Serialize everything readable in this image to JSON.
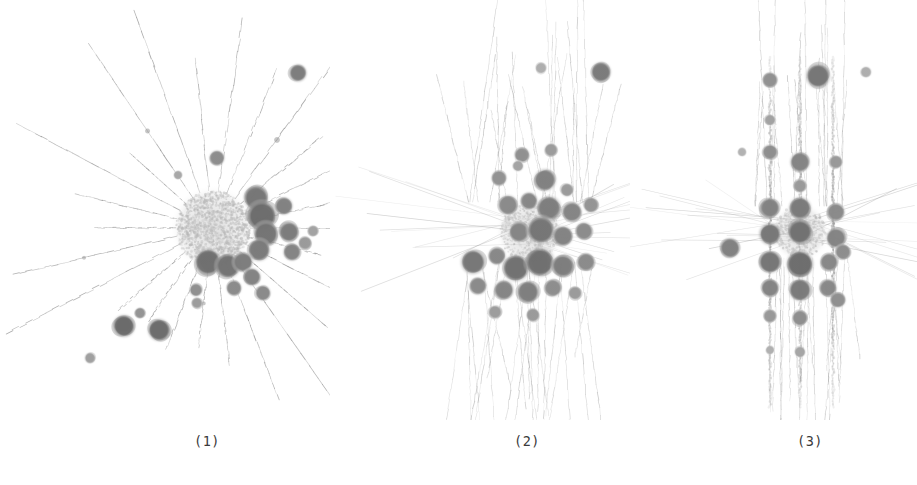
{
  "figure": {
    "width": 917,
    "height": 485,
    "background": "#ffffff",
    "ink_color": "#707070",
    "core_color": "#d8d8d8",
    "node_dark_color": "#6e6e6e",
    "edge_color": "#9a9a9a"
  },
  "panels": [
    {
      "id": "panel-1",
      "caption": "(1)",
      "layout_type": "radial-star",
      "x": 0,
      "y": 0,
      "width": 330,
      "height": 420,
      "caption_x": 207,
      "center_x": 213,
      "center_y": 228,
      "core_radius": 37,
      "spoke_count": 26,
      "description": "Dense light core with long radial spokes and dark satellite node clusters concentrated to the right and lower-right."
    },
    {
      "id": "panel-2",
      "caption": "(2)",
      "layout_type": "scattered-cluster",
      "x": 330,
      "y": 0,
      "width": 300,
      "height": 420,
      "caption_x": 527,
      "center_x": 530,
      "center_y": 235,
      "core_radius": 30,
      "spoke_count": 40,
      "description": "Diffuse cloud of medium grey blobs with faint vertical streaks fanning above and below the centre."
    },
    {
      "id": "panel-3",
      "caption": "(3)",
      "layout_type": "vertical-bands",
      "x": 630,
      "y": 0,
      "width": 287,
      "height": 420,
      "caption_x": 810,
      "center_x": 800,
      "center_y": 235,
      "core_radius": 26,
      "spoke_count": 30,
      "description": "Three dominant vertical columns of stacked node blobs with horizontal spokes crossing the middle band."
    }
  ],
  "chart_data": {
    "type": "scatter",
    "title": "",
    "xlabel": "",
    "ylabel": "",
    "legend": [],
    "panels": [
      {
        "label": "(1)",
        "name": "radial-star",
        "core": {
          "cx": 213,
          "cy": 228,
          "r": 37,
          "fill": "#d8d8d8",
          "dot_count": 1400
        },
        "spoke_angles_deg": [
          0,
          14,
          27,
          41,
          55,
          69,
          83,
          97,
          111,
          125,
          139,
          153,
          167,
          180,
          194,
          208,
          222,
          236,
          250,
          264,
          278,
          292,
          306,
          320,
          334,
          348
        ],
        "spoke_length_range": [
          70,
          205
        ],
        "nodes": [
          {
            "x": 298,
            "y": 73,
            "r": 8,
            "shade": "#7d7d7d"
          },
          {
            "x": 217,
            "y": 158,
            "r": 7,
            "shade": "#8d8d8d"
          },
          {
            "x": 178,
            "y": 175,
            "r": 4,
            "shade": "#a8a8a8"
          },
          {
            "x": 256,
            "y": 198,
            "r": 11,
            "shade": "#767676"
          },
          {
            "x": 262,
            "y": 216,
            "r": 13,
            "shade": "#6d6d6d"
          },
          {
            "x": 266,
            "y": 234,
            "r": 11,
            "shade": "#757575"
          },
          {
            "x": 259,
            "y": 250,
            "r": 10,
            "shade": "#7b7b7b"
          },
          {
            "x": 284,
            "y": 206,
            "r": 8,
            "shade": "#828282"
          },
          {
            "x": 289,
            "y": 232,
            "r": 9,
            "shade": "#7c7c7c"
          },
          {
            "x": 292,
            "y": 252,
            "r": 8,
            "shade": "#848484"
          },
          {
            "x": 305,
            "y": 243,
            "r": 6,
            "shade": "#9a9a9a"
          },
          {
            "x": 313,
            "y": 231,
            "r": 5,
            "shade": "#a3a3a3"
          },
          {
            "x": 208,
            "y": 262,
            "r": 12,
            "shade": "#6f6f6f"
          },
          {
            "x": 228,
            "y": 266,
            "r": 11,
            "shade": "#737373"
          },
          {
            "x": 243,
            "y": 262,
            "r": 9,
            "shade": "#7d7d7d"
          },
          {
            "x": 252,
            "y": 277,
            "r": 8,
            "shade": "#838383"
          },
          {
            "x": 234,
            "y": 288,
            "r": 7,
            "shade": "#8b8b8b"
          },
          {
            "x": 196,
            "y": 290,
            "r": 6,
            "shade": "#909090"
          },
          {
            "x": 263,
            "y": 293,
            "r": 7,
            "shade": "#8a8a8a"
          },
          {
            "x": 197,
            "y": 303,
            "r": 5,
            "shade": "#9d9d9d"
          },
          {
            "x": 124,
            "y": 326,
            "r": 10,
            "shade": "#6a6a6a"
          },
          {
            "x": 159,
            "y": 330,
            "r": 10,
            "shade": "#6c6c6c"
          },
          {
            "x": 140,
            "y": 313,
            "r": 5,
            "shade": "#949494"
          },
          {
            "x": 90,
            "y": 358,
            "r": 5,
            "shade": "#a0a0a0"
          }
        ]
      },
      {
        "label": "(2)",
        "name": "scattered-cluster",
        "core": {
          "cx": 530,
          "cy": 232,
          "r": 30,
          "fill": "#e4e4e4",
          "dot_count": 500
        },
        "streak_count": 46,
        "nodes": [
          {
            "x": 601,
            "y": 72,
            "r": 9,
            "shade": "#7b7b7b"
          },
          {
            "x": 541,
            "y": 68,
            "r": 5,
            "shade": "#aeaeae"
          },
          {
            "x": 522,
            "y": 155,
            "r": 7,
            "shade": "#909090"
          },
          {
            "x": 551,
            "y": 150,
            "r": 6,
            "shade": "#9c9c9c"
          },
          {
            "x": 499,
            "y": 178,
            "r": 7,
            "shade": "#939393"
          },
          {
            "x": 518,
            "y": 166,
            "r": 5,
            "shade": "#a4a4a4"
          },
          {
            "x": 545,
            "y": 180,
            "r": 10,
            "shade": "#818181"
          },
          {
            "x": 567,
            "y": 190,
            "r": 6,
            "shade": "#9b9b9b"
          },
          {
            "x": 508,
            "y": 205,
            "r": 9,
            "shade": "#8a8a8a"
          },
          {
            "x": 529,
            "y": 201,
            "r": 8,
            "shade": "#878787"
          },
          {
            "x": 549,
            "y": 208,
            "r": 11,
            "shade": "#7e7e7e"
          },
          {
            "x": 572,
            "y": 212,
            "r": 9,
            "shade": "#858585"
          },
          {
            "x": 591,
            "y": 205,
            "r": 7,
            "shade": "#949494"
          },
          {
            "x": 519,
            "y": 232,
            "r": 9,
            "shade": "#868686"
          },
          {
            "x": 541,
            "y": 230,
            "r": 12,
            "shade": "#767676"
          },
          {
            "x": 563,
            "y": 236,
            "r": 9,
            "shade": "#838383"
          },
          {
            "x": 584,
            "y": 231,
            "r": 8,
            "shade": "#8c8c8c"
          },
          {
            "x": 473,
            "y": 262,
            "r": 11,
            "shade": "#777777"
          },
          {
            "x": 497,
            "y": 256,
            "r": 8,
            "shade": "#888888"
          },
          {
            "x": 516,
            "y": 268,
            "r": 12,
            "shade": "#727272"
          },
          {
            "x": 540,
            "y": 262,
            "r": 13,
            "shade": "#6f6f6f"
          },
          {
            "x": 563,
            "y": 266,
            "r": 10,
            "shade": "#7d7d7d"
          },
          {
            "x": 586,
            "y": 262,
            "r": 8,
            "shade": "#8b8b8b"
          },
          {
            "x": 478,
            "y": 286,
            "r": 8,
            "shade": "#8a8a8a"
          },
          {
            "x": 504,
            "y": 290,
            "r": 9,
            "shade": "#858585"
          },
          {
            "x": 528,
            "y": 292,
            "r": 10,
            "shade": "#7f7f7f"
          },
          {
            "x": 553,
            "y": 288,
            "r": 8,
            "shade": "#8d8d8d"
          },
          {
            "x": 575,
            "y": 293,
            "r": 6,
            "shade": "#9b9b9b"
          },
          {
            "x": 495,
            "y": 312,
            "r": 6,
            "shade": "#9d9d9d"
          },
          {
            "x": 533,
            "y": 315,
            "r": 6,
            "shade": "#9a9a9a"
          }
        ]
      },
      {
        "label": "(3)",
        "name": "vertical-bands",
        "core": {
          "cx": 800,
          "cy": 232,
          "r": 26,
          "fill": "#e6e6e6",
          "dot_count": 380
        },
        "band_x": [
          770,
          800,
          833
        ],
        "streak_count": 38,
        "nodes": [
          {
            "x": 818,
            "y": 76,
            "r": 11,
            "shade": "#767676"
          },
          {
            "x": 770,
            "y": 80,
            "r": 7,
            "shade": "#919191"
          },
          {
            "x": 866,
            "y": 72,
            "r": 5,
            "shade": "#aeaeae"
          },
          {
            "x": 770,
            "y": 120,
            "r": 5,
            "shade": "#a2a2a2"
          },
          {
            "x": 770,
            "y": 152,
            "r": 7,
            "shade": "#8e8e8e"
          },
          {
            "x": 800,
            "y": 162,
            "r": 9,
            "shade": "#858585"
          },
          {
            "x": 800,
            "y": 186,
            "r": 6,
            "shade": "#9a9a9a"
          },
          {
            "x": 836,
            "y": 162,
            "r": 6,
            "shade": "#999999"
          },
          {
            "x": 742,
            "y": 152,
            "r": 4,
            "shade": "#b2b2b2"
          },
          {
            "x": 770,
            "y": 208,
            "r": 9,
            "shade": "#828282"
          },
          {
            "x": 800,
            "y": 208,
            "r": 10,
            "shade": "#7b7b7b"
          },
          {
            "x": 836,
            "y": 212,
            "r": 8,
            "shade": "#8a8a8a"
          },
          {
            "x": 770,
            "y": 234,
            "r": 10,
            "shade": "#787878"
          },
          {
            "x": 800,
            "y": 232,
            "r": 11,
            "shade": "#727272"
          },
          {
            "x": 836,
            "y": 238,
            "r": 9,
            "shade": "#848484"
          },
          {
            "x": 730,
            "y": 248,
            "r": 9,
            "shade": "#818181"
          },
          {
            "x": 770,
            "y": 262,
            "r": 10,
            "shade": "#767676"
          },
          {
            "x": 800,
            "y": 264,
            "r": 12,
            "shade": "#6e6e6e"
          },
          {
            "x": 829,
            "y": 262,
            "r": 8,
            "shade": "#888888"
          },
          {
            "x": 843,
            "y": 252,
            "r": 7,
            "shade": "#8d8d8d"
          },
          {
            "x": 770,
            "y": 288,
            "r": 8,
            "shade": "#848484"
          },
          {
            "x": 800,
            "y": 290,
            "r": 10,
            "shade": "#7a7a7a"
          },
          {
            "x": 828,
            "y": 288,
            "r": 8,
            "shade": "#888888"
          },
          {
            "x": 838,
            "y": 300,
            "r": 7,
            "shade": "#909090"
          },
          {
            "x": 770,
            "y": 316,
            "r": 6,
            "shade": "#999999"
          },
          {
            "x": 800,
            "y": 318,
            "r": 7,
            "shade": "#8e8e8e"
          },
          {
            "x": 770,
            "y": 350,
            "r": 4,
            "shade": "#b0b0b0"
          },
          {
            "x": 800,
            "y": 352,
            "r": 5,
            "shade": "#a6a6a6"
          }
        ]
      }
    ]
  }
}
